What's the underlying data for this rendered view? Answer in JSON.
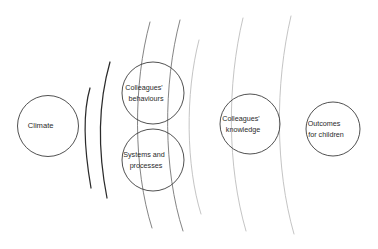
{
  "diagram": {
    "type": "concentric-ripple-influence-diagram",
    "background_color": "#ffffff",
    "canvas": {
      "width": 378,
      "height": 249
    },
    "colors": {
      "circle_stroke": "#3d3d3d",
      "text": "#2a2a2a",
      "ripple_dark": "#2b2b2b",
      "ripple_mid": "#6e6e6e",
      "ripple_light": "#b9b9b9"
    },
    "nodes": [
      {
        "id": "climate",
        "label": "Climate",
        "label_lines": [
          "Climate"
        ],
        "cx": 48,
        "cy": 126,
        "r": 30.5
      },
      {
        "id": "colleagues-behaviours",
        "label": "Colleagues' behaviours",
        "label_lines": [
          "Colleagues'",
          "behaviours"
        ],
        "cx": 153,
        "cy": 93,
        "r": 31
      },
      {
        "id": "systems-and-processes",
        "label": "Systems and processes",
        "label_lines": [
          "Systems and",
          "processes"
        ],
        "cx": 153,
        "cy": 160,
        "r": 31
      },
      {
        "id": "colleagues-knowledge",
        "label": "Colleagues' knowledge",
        "label_lines": [
          "Colleagues'",
          "knowledge"
        ],
        "cx": 250,
        "cy": 124,
        "r": 30
      },
      {
        "id": "outcomes-for-children",
        "label": "Outcomes for children",
        "label_lines": [
          "Outcomes",
          "for children"
        ],
        "cx": 333,
        "cy": 129,
        "r": 27
      }
    ],
    "ripples": [
      {
        "id": "ripple-1",
        "tone": "dark",
        "path": "M 90 88 C 83 112 83 142 91 188"
      },
      {
        "id": "ripple-2",
        "tone": "dark",
        "path": "M 110 62 C 98 104 98 152 107 198"
      },
      {
        "id": "ripple-3",
        "tone": "mid",
        "path": "M 150 22 C 133 84 133 168 152 228"
      },
      {
        "id": "ripple-4",
        "tone": "mid",
        "path": "M 180 20 C 163 84 163 170 183 231"
      },
      {
        "id": "ripple-5",
        "tone": "light",
        "path": "M 199 40 C 185 94 186 166 201 214"
      },
      {
        "id": "ripple-6",
        "tone": "light",
        "path": "M 243 18 C 227 84 227 166 246 231"
      },
      {
        "id": "ripple-7",
        "tone": "light",
        "path": "M 291 16 C 275 84 275 168 294 234"
      }
    ]
  }
}
